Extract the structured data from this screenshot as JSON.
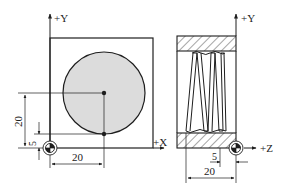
{
  "colors": {
    "line": "#1e1e1e",
    "circle_fill": "#dcdcdc",
    "background": "#ffffff"
  },
  "left_view": {
    "axis_y_label": "+Y",
    "axis_x_label": "+X",
    "dim_vertical_20": "20",
    "dim_vertical_5": "5",
    "dim_horizontal_20": "20",
    "origin_symbol": "workpiece-zero-icon"
  },
  "right_view": {
    "axis_y_label": "+Y",
    "axis_z_label": "+Z",
    "dim_horizontal_5": "5",
    "dim_horizontal_20": "20",
    "origin_symbol": "workpiece-zero-icon"
  }
}
